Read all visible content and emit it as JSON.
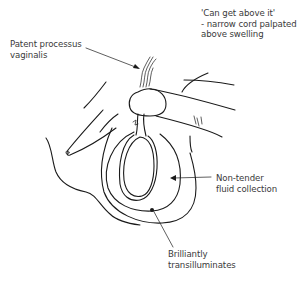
{
  "diagram": {
    "labels": {
      "cord": {
        "lines": [
          "'Can get above it'",
          "- narrow cord palpated",
          "above swelling"
        ]
      },
      "patent": {
        "lines": [
          "Patent processus",
          "vaginalis"
        ]
      },
      "fluid": {
        "lines": [
          "Non-tender",
          "fluid collection"
        ]
      },
      "transillum": {
        "lines": [
          "Brilliantly",
          "transilluminates"
        ]
      }
    },
    "colors": {
      "line": "#1a1a1a",
      "text": "#3a3a3a",
      "background": "#ffffff"
    }
  }
}
